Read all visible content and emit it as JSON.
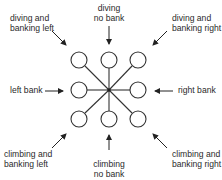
{
  "diagram": {
    "labels": {
      "diving_banking_left": [
        "diving and",
        "banking left"
      ],
      "diving_no_bank": [
        "diving",
        "no bank"
      ],
      "diving_banking_right": [
        "diving and",
        "banking right"
      ],
      "left_bank": "left bank",
      "right_bank": "right bank",
      "climbing_banking_left": [
        "climbing and",
        "banking left"
      ],
      "climbing_no_bank": [
        "climbing",
        "no bank"
      ],
      "climbing_banking_right": [
        "climbing and",
        "banking right"
      ]
    },
    "grid": {
      "columns_x": [
        79,
        109,
        138
      ],
      "rows_y": [
        60,
        90,
        119
      ],
      "circle_radius": 8,
      "center": [
        109,
        90
      ]
    },
    "colors": {
      "stroke": "#333333",
      "background": "#ffffff"
    }
  }
}
